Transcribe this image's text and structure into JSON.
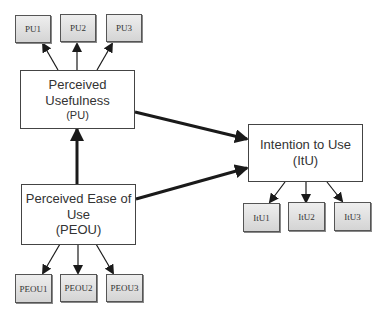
{
  "diagram": {
    "type": "Technology Acceptance Model path diagram",
    "constructs": {
      "pu": {
        "title_line1": "Perceived",
        "title_line2": "Usefulness",
        "abbr": "(PU)"
      },
      "peou": {
        "title_line1": "Perceived Ease of",
        "title_line2": "Use",
        "abbr": "(PEOU)"
      },
      "itu": {
        "title_line1": "Intention to Use",
        "abbr": "(ItU)"
      }
    },
    "indicators": {
      "pu": [
        "PU1",
        "PU2",
        "PU3"
      ],
      "peou": [
        "PEOU1",
        "PEOU2",
        "PEOU3"
      ],
      "itu": [
        "ItU1",
        "ItU2",
        "ItU3"
      ]
    },
    "paths": [
      {
        "from": "PEOU",
        "to": "PU"
      },
      {
        "from": "PU",
        "to": "ItU"
      },
      {
        "from": "PEOU",
        "to": "ItU"
      }
    ],
    "colors": {
      "line": "#1a1a1a",
      "box_border": "#444444",
      "indicator_fill_top": "#eeeeee",
      "indicator_fill_bottom": "#d4d4d4"
    }
  }
}
